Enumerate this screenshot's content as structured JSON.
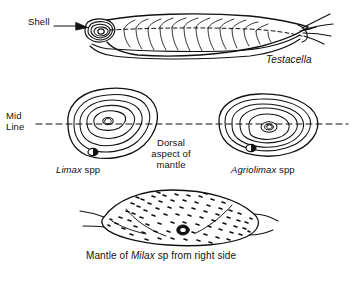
{
  "figure": {
    "background_color": "#ffffff",
    "ink_color": "#111111"
  },
  "labels": {
    "shell": "Shell",
    "testacella": "Testacella",
    "midline_line1": "Mid",
    "midline_line2": "Line",
    "dorsal_line1": "Dorsal",
    "dorsal_line2": "aspect of",
    "dorsal_line3": "mantle",
    "limax_genus": "Limax",
    "limax_suffix": "spp",
    "agriolimax_genus": "Agriolimax",
    "agriolimax_suffix": "spp",
    "milax_caption_pre": "Mantle of ",
    "milax_genus": "Milax",
    "milax_caption_post": " sp from right side"
  },
  "panels": [
    {
      "id": "testacella",
      "name": "Testacella whole animal, left lateral view",
      "label": "Testacella",
      "features": [
        "shell",
        "dashed-midline",
        "lateral-grooves",
        "tail-tentacles"
      ]
    },
    {
      "id": "limax",
      "name": "Limax spp dorsal mantle",
      "label": "Limax spp",
      "rings": 5,
      "pneumostome_position": "below-midline-left-of-centre",
      "centre_mark": "small-oval-nucleus"
    },
    {
      "id": "agriolimax",
      "name": "Agriolimax spp dorsal mantle",
      "label": "Agriolimax spp",
      "rings": 5,
      "pneumostome_position": "below-centre",
      "centre_mark": "small-oval-nucleus"
    },
    {
      "id": "milax",
      "name": "Milax sp mantle from right side",
      "label": "Mantle of Milax sp from right side",
      "features": [
        "speckled-texture",
        "ring-pneumostome",
        "keel-lines"
      ]
    }
  ]
}
